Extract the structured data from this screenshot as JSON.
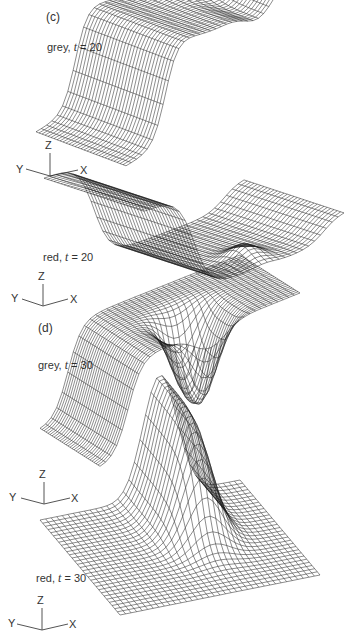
{
  "figure": {
    "panels": [
      {
        "id": "c",
        "label": "(c)",
        "plots": [
          {
            "name": "grey",
            "t_symbol": "t",
            "t_value": "20",
            "caption_prefix": "grey, ",
            "caption_eq": " = 20"
          },
          {
            "name": "red",
            "t_symbol": "t",
            "t_value": "20",
            "caption_prefix": "red, ",
            "caption_eq": " = 20"
          }
        ]
      },
      {
        "id": "d",
        "label": "(d)",
        "plots": [
          {
            "name": "grey",
            "t_symbol": "t",
            "t_value": "30",
            "caption_prefix": "grey, ",
            "caption_eq": " = 30"
          },
          {
            "name": "red",
            "t_symbol": "t",
            "t_value": "30",
            "caption_prefix": "red, ",
            "caption_eq": " = 30"
          }
        ]
      }
    ],
    "axes": {
      "x": "X",
      "y": "Y",
      "z": "Z"
    },
    "style": {
      "line_color": "#1a1a1a",
      "background": "#ffffff"
    }
  },
  "chart_data": [
    {
      "type": "surface",
      "title": "grey, t = 20",
      "panel": "(c)",
      "axes": [
        "X",
        "Y",
        "Z"
      ],
      "description": "Wireframe surface: low flat plateau at front-left, steep rise to high plateau with shallow ripple toward back/right"
    },
    {
      "type": "surface",
      "title": "red, t = 20",
      "panel": "(c)",
      "axes": [
        "X",
        "Y",
        "Z"
      ],
      "description": "Wireframe surface: flat upper sheet at left dropping into a deep trough/basin across center and right"
    },
    {
      "type": "surface",
      "title": "grey, t = 30",
      "panel": "(d)",
      "axes": [
        "X",
        "Y",
        "Z"
      ],
      "description": "Wireframe surface: high plateau over most of domain with steep front edge and a hanging well at center-right"
    },
    {
      "type": "surface",
      "title": "red, t = 30",
      "panel": "(d)",
      "axes": [
        "X",
        "Y",
        "Z"
      ],
      "description": "Wireframe surface: low flat floor with steep left wall and a tall rounded peak at center-right"
    }
  ]
}
